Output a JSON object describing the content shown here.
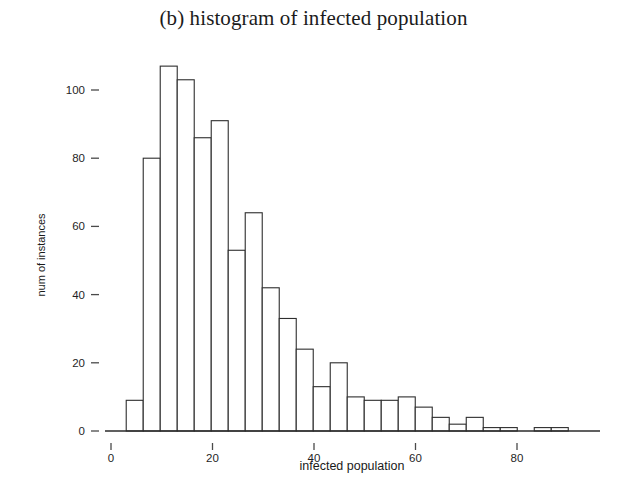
{
  "figure": {
    "title": "(b) histogram of infected population",
    "background_color": "#ffffff",
    "ink_color": "#2b2b2b"
  },
  "axes": {
    "x": {
      "label": "infected population",
      "ticks": [
        0,
        20,
        40,
        60,
        80
      ],
      "tick_labels": [
        "0",
        "20",
        "40",
        "60",
        "80"
      ],
      "range": [
        -2,
        97
      ]
    },
    "y": {
      "label": "num of instances",
      "ticks": [
        0,
        20,
        40,
        60,
        80,
        100
      ],
      "tick_labels": [
        "0",
        "20",
        "40",
        "60",
        "80",
        "100"
      ],
      "range": [
        0,
        112
      ]
    }
  },
  "chart_data": {
    "type": "bar",
    "title": "(b) histogram of infected population",
    "xlabel": "infected population",
    "ylabel": "num of instances",
    "xlim": [
      -2,
      97
    ],
    "ylim": [
      0,
      112
    ],
    "grid": false,
    "legend": false,
    "bin_width": 3.35,
    "bin_starts": [
      3.0,
      6.35,
      9.7,
      13.05,
      16.4,
      19.75,
      23.1,
      26.45,
      29.8,
      33.15,
      36.5,
      39.85,
      43.2,
      46.55,
      49.9,
      53.25,
      56.6,
      59.95,
      63.3,
      66.65,
      70.0,
      73.35,
      76.7,
      80.05,
      83.4,
      86.75
    ],
    "categories": [
      "3.0-6.3",
      "6.3-9.7",
      "9.7-13.1",
      "13.1-16.4",
      "16.4-19.8",
      "19.8-23.1",
      "23.1-26.4",
      "26.4-29.8",
      "29.8-33.2",
      "33.2-36.5",
      "36.5-39.8",
      "39.8-43.2",
      "43.2-46.6",
      "46.6-49.9",
      "49.9-53.2",
      "53.2-56.6",
      "56.6-60.0",
      "60.0-63.3",
      "63.3-66.7",
      "66.7-70.0",
      "70.0-73.4",
      "73.4-76.7",
      "76.7-80.1",
      "80.1-83.4",
      "83.4-86.8",
      "86.8-90.1"
    ],
    "values": [
      9,
      80,
      107,
      103,
      86,
      91,
      53,
      64,
      42,
      33,
      24,
      13,
      20,
      10,
      9,
      9,
      10,
      7,
      4,
      2,
      4,
      1,
      1,
      0,
      1,
      1
    ],
    "peak_value": 107,
    "peak_bin": "9.7-13.1"
  }
}
